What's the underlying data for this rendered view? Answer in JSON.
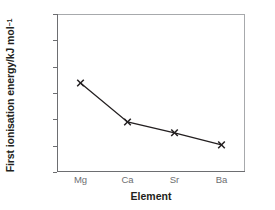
{
  "chart_data": {
    "type": "line",
    "title": "",
    "subtitle": "",
    "xlabel": "Element",
    "ylabel": "First ionisation energy/kJ mol",
    "ylabel_superscript": "−1",
    "categories": [
      "Mg",
      "Ca",
      "Sr",
      "Ba"
    ],
    "values": [
      738,
      590,
      549,
      503
    ],
    "series": [
      {
        "name": "First ionisation energy",
        "values": [
          738,
          590,
          549,
          503
        ]
      }
    ],
    "ylim": [
      400,
      1000
    ],
    "ytick_labels": [
      "1000",
      "900",
      "800",
      "700",
      "600",
      "500",
      "400"
    ],
    "ytick_values": [
      1000,
      900,
      800,
      700,
      600,
      500,
      400
    ],
    "xtick_labels": [
      "Mg",
      "Ca",
      "Sr",
      "Ba"
    ],
    "grid": false,
    "legend": false,
    "legend_position": "none",
    "marker": "x",
    "line_color": "#231f20",
    "marker_color": "#231f20",
    "axis_color": "#6d6e71",
    "frame_color": "#a7a9ac",
    "tick_label_color": "#6d6e71",
    "axis_title_color": "#231f20",
    "background_color": "#ffffff"
  }
}
